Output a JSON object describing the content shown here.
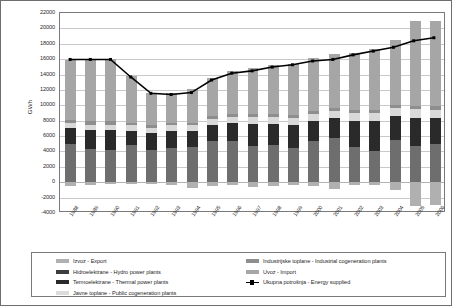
{
  "chart_data": {
    "type": "bar",
    "title": "",
    "xlabel": "",
    "ylabel": "GWh",
    "ylim": [
      -4000,
      22000
    ],
    "ytick_step": 2000,
    "grid": true,
    "stacked": true,
    "legend_position": "bottom",
    "yticks": [
      "22000",
      "20000",
      "18000",
      "16000",
      "14000",
      "12000",
      "10000",
      "8000",
      "6000",
      "4000",
      "2000",
      "0",
      "-2000",
      "-4000"
    ],
    "categories": [
      "1988",
      "1989",
      "1990",
      "1991",
      "1992",
      "1993",
      "1994",
      "1995",
      "1996",
      "1997",
      "1998",
      "1999",
      "2000",
      "2001",
      "2002",
      "2003",
      "2004",
      "2005",
      "2006"
    ],
    "series": [
      {
        "name": "Izvoz - Export",
        "color": "#b0b0b0",
        "sign": "negative",
        "values": [
          -450,
          -300,
          -250,
          -200,
          -250,
          -350,
          -700,
          -450,
          -400,
          -600,
          -450,
          -350,
          -450,
          -900,
          -400,
          -400,
          -1000,
          -3100,
          -2900
        ]
      },
      {
        "name": "Hidroelektrane - Hydro power plants",
        "color": "#6e6e6e",
        "values": [
          5000,
          4300,
          4200,
          4900,
          4200,
          4500,
          4600,
          5300,
          5400,
          4700,
          4800,
          4400,
          5400,
          5800,
          4600,
          4100,
          5500,
          4700,
          5000
        ]
      },
      {
        "name": "Termoelektrane  - Thermal power plants",
        "color": "#2a2a2a",
        "values": [
          2000,
          2500,
          2600,
          1800,
          2200,
          2200,
          2100,
          2100,
          2300,
          2900,
          2800,
          3000,
          2500,
          2500,
          3400,
          3900,
          3100,
          3700,
          3300
        ]
      },
      {
        "name": "Javne toplane - Public cogeneration plants",
        "color": "#d9d9d9",
        "values": [
          650,
          700,
          700,
          700,
          700,
          700,
          700,
          800,
          800,
          900,
          900,
          900,
          950,
          950,
          1000,
          1050,
          1100,
          1100,
          1150
        ]
      },
      {
        "name": "Industrijske toplane - Industrial cogeneration plants",
        "color": "#8e8e8e",
        "values": [
          400,
          400,
          400,
          350,
          350,
          350,
          350,
          400,
          400,
          400,
          400,
          400,
          400,
          400,
          400,
          400,
          400,
          400,
          400
        ]
      },
      {
        "name": "Uvoz - Import",
        "color": "#a6a6a6",
        "values": [
          7900,
          8100,
          8100,
          6000,
          4100,
          3800,
          4400,
          5000,
          5600,
          6000,
          6400,
          6700,
          6900,
          7000,
          7400,
          7900,
          8400,
          11100,
          11100
        ]
      }
    ],
    "line_series": {
      "name": "Ukupna potrošnja - Energy supplied",
      "color": "#000000",
      "values": [
        15900,
        15900,
        15900,
        13600,
        11450,
        11300,
        11550,
        13200,
        14100,
        14400,
        14900,
        15200,
        15700,
        15900,
        16500,
        17000,
        17500,
        18350,
        18750
      ]
    },
    "legend": [
      {
        "label": "Izvoz - Export",
        "swatch": "#b0b0b0",
        "type": "bar",
        "column": 1
      },
      {
        "label": "Hidroelektrane - Hydro power plants",
        "swatch": "#3d3d3d",
        "type": "bar",
        "column": 1
      },
      {
        "label": "Termoelektrane  - Thermal power plants",
        "swatch": "#2a2a2a",
        "type": "bar",
        "column": 1
      },
      {
        "label": "Javne toplane - Public cogeneration plants",
        "swatch": "#dcdcdc",
        "type": "bar",
        "column": 1
      },
      {
        "label": "Industrijske toplane - Industrial cogeneration plants",
        "swatch": "#8e8e8e",
        "type": "bar",
        "column": 2
      },
      {
        "label": "Uvoz - Import",
        "swatch": "#a6a6a6",
        "type": "bar",
        "column": 2
      },
      {
        "label": "Ukupna potrošnja - Energy supplied",
        "swatch": "#000000",
        "type": "line",
        "column": 2
      }
    ]
  }
}
